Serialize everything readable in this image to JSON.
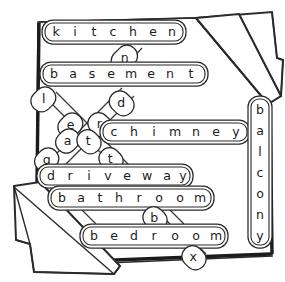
{
  "diagram": {
    "type": "word-grid-sketch",
    "style": "hand-drawn black ink on white paper with folded corners",
    "colors": {
      "ink": "#1b1b1b",
      "stroke": "#2b2b2b",
      "paper": "#ffffff",
      "capsule_stroke": "#2a2a2a"
    },
    "horizontal_words": [
      {
        "id": "kitchen",
        "text": "kitchen",
        "letters": [
          "k",
          "i",
          "t",
          "c",
          "h",
          "e",
          "n"
        ]
      },
      {
        "id": "basement",
        "text": "basement",
        "letters": [
          "b",
          "a",
          "s",
          "e",
          "m",
          "e",
          "n",
          "t"
        ]
      },
      {
        "id": "chimney",
        "text": "chimney",
        "letters": [
          "c",
          "h",
          "i",
          "m",
          "n",
          "e",
          "y"
        ]
      },
      {
        "id": "driveway",
        "text": "driveway",
        "letters": [
          "d",
          "r",
          "i",
          "v",
          "e",
          "w",
          "a",
          "y"
        ]
      },
      {
        "id": "bathroom",
        "text": "bathroom",
        "letters": [
          "b",
          "a",
          "t",
          "h",
          "r",
          "o",
          "o",
          "m"
        ]
      },
      {
        "id": "bedroom",
        "text": "bedroom",
        "letters": [
          "b",
          "e",
          "d",
          "r",
          "o",
          "o",
          "m"
        ]
      }
    ],
    "vertical_words": [
      {
        "id": "balcony",
        "text": "balcony",
        "letters": [
          "b",
          "a",
          "l",
          "c",
          "o",
          "n",
          "y"
        ]
      }
    ],
    "diagonal_letters": [
      {
        "id": "diag-n",
        "letter": "n"
      },
      {
        "id": "diag-l",
        "letter": "l"
      },
      {
        "id": "diag-d",
        "letter": "d"
      },
      {
        "id": "diag-e",
        "letter": "e"
      },
      {
        "id": "diag-r",
        "letter": "r"
      },
      {
        "id": "diag-a",
        "letter": "a"
      },
      {
        "id": "diag-t1",
        "letter": "t"
      },
      {
        "id": "diag-g",
        "letter": "g"
      },
      {
        "id": "diag-t2",
        "letter": "t"
      },
      {
        "id": "diag-b",
        "letter": "b"
      },
      {
        "id": "diag-x",
        "letter": "x"
      }
    ]
  }
}
